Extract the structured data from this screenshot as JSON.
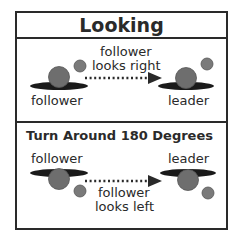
{
  "title": "Looking",
  "panel1": {
    "caption_line1": "follower",
    "caption_line2": "looks right",
    "left_label": "follower",
    "right_label": "leader"
  },
  "panel2": {
    "title": "Turn Around 180 Degrees",
    "left_label": "follower",
    "right_label": "leader",
    "caption_line1": "follower",
    "caption_line2": "looks left"
  },
  "colors": {
    "body": "#6e6e6e",
    "head": "#7a7a7a",
    "shadow": "#1a1a1a",
    "border": "#2a2a2a"
  }
}
